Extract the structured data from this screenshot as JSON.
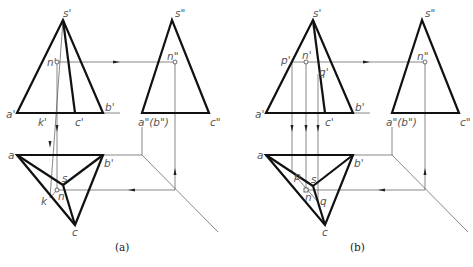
{
  "figures": [
    {
      "id": "a",
      "caption": "(a)",
      "front_view": {
        "s": "s'",
        "a": "a'",
        "b": "b'",
        "c": "c'",
        "n": "n'",
        "k": "k'"
      },
      "side_view": {
        "s": "s\"",
        "ab": "a\"(b\")",
        "c": "c\"",
        "n": "n\""
      },
      "top_view": {
        "a": "a",
        "b": "b'",
        "c": "c",
        "s": "s",
        "n": "n",
        "k": "k"
      }
    },
    {
      "id": "b",
      "caption": "(b)",
      "front_view": {
        "s": "s'",
        "a": "a'",
        "b": "b'",
        "c": "c'",
        "n": "n'",
        "p": "p'",
        "q": "q'"
      },
      "side_view": {
        "s": "s\"",
        "ab": "a\"(b\")",
        "c": "c\"",
        "n": "n\""
      },
      "top_view": {
        "a": "a",
        "b": "b'",
        "c": "c",
        "s": "s",
        "n": "n",
        "p": "p",
        "q": "q"
      }
    }
  ],
  "colors": {
    "outline": "#111111",
    "projection_line": "#555555",
    "label": "#555555"
  }
}
